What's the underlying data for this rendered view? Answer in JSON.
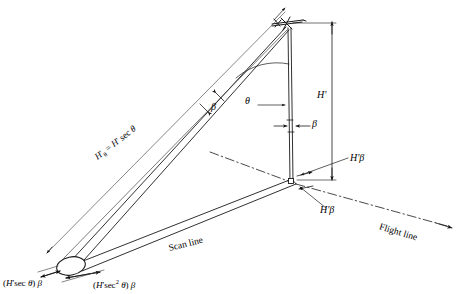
{
  "figure": {
    "type": "line-diagram",
    "background_color": "#ffffff",
    "line_color": "#1a1a1a"
  },
  "labels": {
    "slant_range": {
      "text": "H'θ = H' sec θ",
      "parts": {
        "lead": "H",
        "prime": "'",
        "sub": "θ",
        "eq": " = ",
        "h2": "H",
        "prime2": "'",
        "sec": " sec ",
        "theta": "θ"
      }
    },
    "height": "H'",
    "angle_theta": "θ",
    "angle_beta_slant": "β",
    "angle_beta_vertical": "β",
    "ground_cell_upper": "H'β",
    "ground_cell_lower": "H'β",
    "scan_line": "Scan line",
    "flight_line": "Flight line",
    "cell_width": {
      "open": "(",
      "h": "H",
      "prime": "'",
      "sec": "sec ",
      "theta": "θ",
      "close": ") ",
      "beta": "β"
    },
    "cell_length": {
      "open": "(",
      "h": "H",
      "prime": "'",
      "sec": "sec",
      "exp": "2",
      "theta": " θ",
      "close": ") ",
      "beta": "β"
    }
  },
  "icons": {
    "aircraft": "aircraft-icon",
    "resolution_cell": "ellipse-ground-cell",
    "flight_arrow": "arrowhead-icon",
    "dimension_arrow": "double-arrow-icon"
  },
  "geometry": {
    "aircraft_apex": [
      288,
      26
    ],
    "nadir_point": [
      290,
      181
    ],
    "ground_cell": [
      72,
      266
    ],
    "flight_arrow_end": [
      452,
      228
    ],
    "dimension_line_x": 332
  }
}
